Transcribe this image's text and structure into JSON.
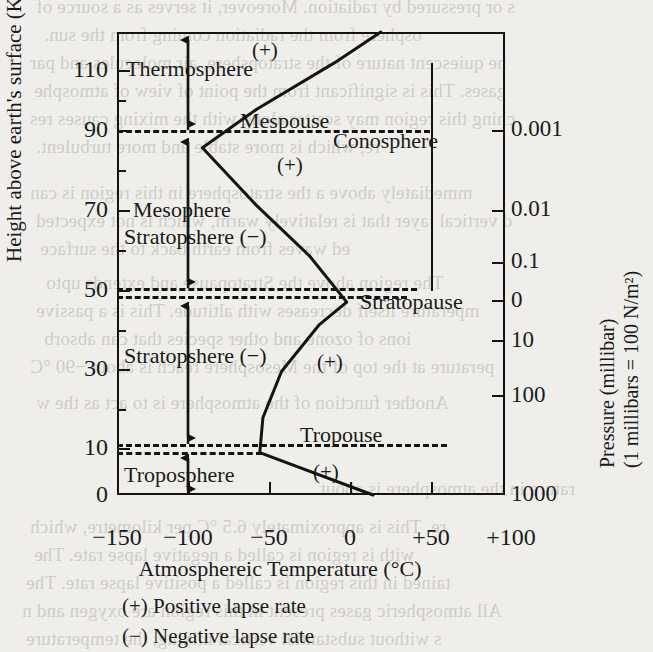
{
  "chart_data": {
    "type": "line",
    "title": "",
    "xlabel": "Atmosphereic Temperature (°C)",
    "ylabel": "Height above earth's surface (Kms)",
    "y2label_line1": "Pressure (millibar)",
    "y2label_line2": "(1 millibars = 100 N/m²)",
    "xlim": [
      -150,
      100
    ],
    "ylim": [
      0,
      120
    ],
    "grid": false,
    "legend_position": "below-axis",
    "xticks": [
      "−150",
      "−100",
      "−50",
      "0",
      "+50",
      "+100"
    ],
    "xtick_values": [
      -150,
      -100,
      -50,
      0,
      50,
      100
    ],
    "yticks": [
      "0",
      "10",
      "30",
      "50",
      "70",
      "90",
      "110"
    ],
    "ytick_values": [
      0,
      10,
      30,
      50,
      70,
      90,
      110
    ],
    "yticks_minor": [
      20,
      40,
      60,
      80,
      100
    ],
    "pressure_ticks": [
      "0.001",
      "0.01",
      "0.1",
      "0",
      "10",
      "100",
      "1000"
    ],
    "pressure_tick_heights": [
      90,
      70,
      57,
      48,
      38,
      25,
      0
    ],
    "series": [
      {
        "name": "Atmospheric temperature profile",
        "points": [
          {
            "temp": 15,
            "height": 0
          },
          {
            "temp": -58,
            "height": 11
          },
          {
            "temp": -56,
            "height": 20
          },
          {
            "temp": -44,
            "height": 32
          },
          {
            "temp": -20,
            "height": 44
          },
          {
            "temp": -2,
            "height": 50
          },
          {
            "temp": -26,
            "height": 62
          },
          {
            "temp": -60,
            "height": 75
          },
          {
            "temp": -95,
            "height": 90
          },
          {
            "temp": -60,
            "height": 100
          },
          {
            "temp": -10,
            "height": 112
          },
          {
            "temp": 20,
            "height": 120
          }
        ]
      }
    ],
    "boundaries": [
      {
        "name": "Mespouse",
        "height": 90
      },
      {
        "name": "Stratopause",
        "height": 50
      },
      {
        "name": "Tropouse",
        "height": 10
      }
    ],
    "layers": [
      {
        "name": "Thermosphere",
        "range": [
          90,
          120
        ],
        "lapse": "+"
      },
      {
        "name": "Mesophere",
        "range": [
          50,
          90
        ],
        "lapse": "+"
      },
      {
        "name": "Stratopshere (−)",
        "range": [
          10,
          50
        ],
        "lapse": "−"
      },
      {
        "name": "Troposphere",
        "range": [
          0,
          10
        ],
        "lapse": "+"
      }
    ],
    "annotations": [
      {
        "text": "Conosphere",
        "note": "ionized region spanning stratopause to mesopause"
      }
    ]
  },
  "axes": {
    "y_title": "Height above earth's surface (Kms)",
    "x_title": "Atmosphereic Temperature (°C)",
    "p_title_line1": "Pressure (millibar)",
    "p_title_line2": "(1 millibars = 100 N/m²)",
    "y_ticks": [
      {
        "label": "110",
        "h": 110
      },
      {
        "label": "90",
        "h": 90
      },
      {
        "label": "70",
        "h": 70
      },
      {
        "label": "50",
        "h": 50
      },
      {
        "label": "30",
        "h": 30
      },
      {
        "label": "10",
        "h": 10
      },
      {
        "label": "0",
        "h": 0
      }
    ],
    "p_ticks": [
      {
        "label": "0.001"
      },
      {
        "label": "0.01"
      },
      {
        "label": "0.1"
      },
      {
        "label": "0"
      },
      {
        "label": "10"
      },
      {
        "label": "100"
      },
      {
        "label": "1000"
      }
    ],
    "x_ticks": [
      {
        "label": "−150"
      },
      {
        "label": "−100"
      },
      {
        "label": "−50"
      },
      {
        "label": "0"
      },
      {
        "label": "+50"
      },
      {
        "label": "+100"
      }
    ]
  },
  "labels": {
    "thermosphere": "Thermosphere",
    "mespouse": "Mespouse",
    "mesophere": "Mesophere",
    "stratopshere_upper": "Stratopshere (−)",
    "stratopshere_lower": "Stratopshere (−)",
    "stratopause": "Stratopause",
    "tropouse": "Tropouse",
    "troposphere": "Troposphere",
    "conosphere": "Conosphere",
    "plus_thermo": "(+)",
    "plus_meso": "(+)",
    "plus_strato": "(+)",
    "plus_tropo": "(+)"
  },
  "legend": {
    "positive": "(+) Positive lapse rate",
    "negative": "(−) Negative lapse rate"
  },
  "ghost_text": {
    "lines": [
      "s or pressured by radiation. Moreover, it serves as a source of",
      "osphere from the radiation coming from the sun.",
      "he quiescent nature of the stratopshere, air molecules and par",
      "gases. This is significant from the point of view of atmosphe",
      "ching this region may scatter along with the mixing causes res",
      "re, which is more stable and more turbulent.",
      "mmediately above a the stratosphere in this region is can",
      "d vertical layer that is relatively warm, which is not expected",
      "ed waves from earth back to the surface",
      "The region above the Stratopause and extends upto",
      "mperature itself decreases with altitude. This is a passive",
      "ions of ozone and other species that can absorb",
      "perature at the top of the Mesosphere reach is about −90 °C",
      "Another function of the atmosphere is to act as the w",
      "rature in the atmosphere is about",
      "re. This is approximately 6.5 °C per kilometre, which",
      "with is region is called a negative lapse rate. The",
      "tained in this region is called a positive lapse rate. The",
      "All atmospheric gases present in this region are oxygen and n",
      "s without substantial vertical mixing, the temperature"
    ]
  }
}
